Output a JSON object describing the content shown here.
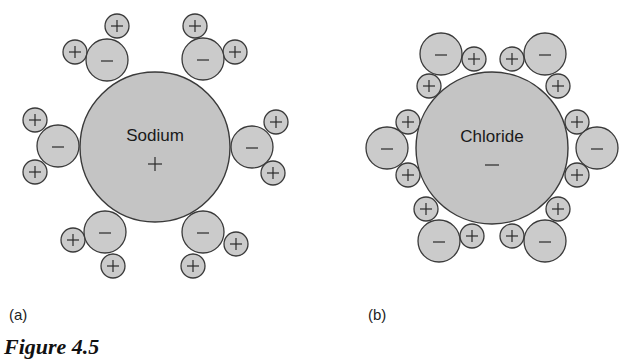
{
  "panels": [
    {
      "id": "a",
      "label": "(a)",
      "ion": {
        "name": "Sodium",
        "charge": "+",
        "cx": 155,
        "cy": 147,
        "r": 75
      },
      "waters": [
        {
          "o": [
            107,
            60
          ],
          "h": [
            [
              75,
              52
            ],
            [
              117,
              26
            ]
          ]
        },
        {
          "o": [
            203,
            59
          ],
          "h": [
            [
              195,
              26
            ],
            [
              235,
              52
            ]
          ]
        },
        {
          "o": [
            58,
            146
          ],
          "h": [
            [
              35,
              120
            ],
            [
              35,
              172
            ]
          ]
        },
        {
          "o": [
            252,
            147
          ],
          "h": [
            [
              276,
              122
            ],
            [
              273,
              173
            ]
          ]
        },
        {
          "o": [
            105,
            232
          ],
          "h": [
            [
              73,
              240
            ],
            [
              113,
              266
            ]
          ]
        },
        {
          "o": [
            203,
            232
          ],
          "h": [
            [
              236,
              244
            ],
            [
              193,
              266
            ]
          ]
        }
      ]
    },
    {
      "id": "b",
      "label": "(b)",
      "ion": {
        "name": "Chloride",
        "charge": "−",
        "cx": 492,
        "cy": 148,
        "r": 76
      },
      "waters": [
        {
          "o": [
            441,
            54
          ],
          "h": [
            [
              474,
              59
            ],
            [
              429,
              86
            ]
          ]
        },
        {
          "o": [
            545,
            54
          ],
          "h": [
            [
              512,
              59
            ],
            [
              558,
              86
            ]
          ]
        },
        {
          "o": [
            387,
            148
          ],
          "h": [
            [
              408,
              122
            ],
            [
              408,
              175
            ]
          ]
        },
        {
          "o": [
            597,
            148
          ],
          "h": [
            [
              577,
              122
            ],
            [
              577,
              175
            ]
          ]
        },
        {
          "o": [
            439,
            241
          ],
          "h": [
            [
              426,
              209
            ],
            [
              472,
              236
            ]
          ]
        },
        {
          "o": [
            545,
            241
          ],
          "h": [
            [
              512,
              236
            ],
            [
              558,
              209
            ]
          ]
        }
      ]
    }
  ],
  "water_signs": {
    "oxygen": "−",
    "hydrogen": "+"
  },
  "caption": "Figure 4.5",
  "colors": {
    "ion_fill": "#c4c4c4",
    "water_fill": "#cbcbcb",
    "stroke": "#3a3a3a"
  }
}
